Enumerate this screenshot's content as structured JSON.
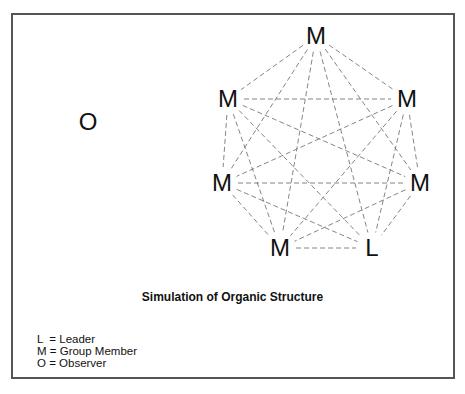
{
  "diagram": {
    "title": "Simulation of Organic Structure",
    "observer": {
      "label": "O",
      "x": 88,
      "y": 122
    },
    "nodes": [
      {
        "label": "M",
        "x": 316,
        "y": 36
      },
      {
        "label": "M",
        "x": 228,
        "y": 99
      },
      {
        "label": "M",
        "x": 407,
        "y": 99
      },
      {
        "label": "M",
        "x": 222,
        "y": 183
      },
      {
        "label": "M",
        "x": 420,
        "y": 183
      },
      {
        "label": "M",
        "x": 280,
        "y": 248
      },
      {
        "label": "L",
        "x": 372,
        "y": 248
      }
    ],
    "edges": "complete graph, dashed",
    "legend": [
      "L  = Leader",
      "M = Group Member",
      "O = Observer"
    ]
  }
}
